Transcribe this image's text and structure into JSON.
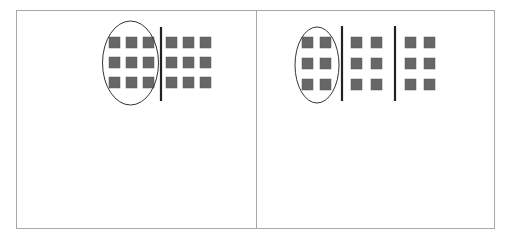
{
  "figure": {
    "colors": {
      "frame": "#a8a8a8",
      "square": "#676767",
      "square_stroke": "#5a5a5a",
      "divider": "#222222",
      "ellipse": "#333333",
      "background": "#ffffff"
    },
    "frame": {
      "x": 16,
      "y": 10,
      "width": 478,
      "height": 218,
      "divider_x": 256
    },
    "panels": [
      {
        "name": "left-panel",
        "grouping": "2 groups of 9 (3x3 each)",
        "ellipse": {
          "cx": 130.5,
          "cy": 63,
          "rx": 28,
          "ry": 42
        },
        "dividers": [
          {
            "x": 161,
            "y1": 27,
            "y2": 101
          }
        ],
        "square_size": 11,
        "columns_x": [
          109,
          126,
          143,
          166,
          183,
          200
        ],
        "rows_y": [
          37,
          57,
          77
        ]
      },
      {
        "name": "right-panel",
        "grouping": "3 groups of 6 (2 cols x 3 rows each)",
        "ellipse": {
          "cx": 317,
          "cy": 65,
          "rx": 22,
          "ry": 38
        },
        "dividers": [
          {
            "x": 342,
            "y1": 26,
            "y2": 101
          },
          {
            "x": 395,
            "y1": 26,
            "y2": 101
          }
        ],
        "square_size": 11,
        "columns_x": [
          302,
          320,
          351,
          371,
          405,
          424
        ],
        "rows_y": [
          37,
          58,
          79
        ]
      }
    ]
  }
}
